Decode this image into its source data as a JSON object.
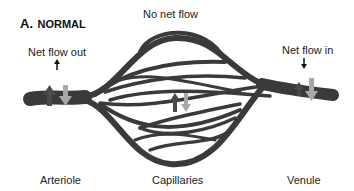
{
  "title": {
    "letter": "A.",
    "text": "NORMAL"
  },
  "labels": {
    "top_center": "No net flow",
    "left_flow": "Net flow out",
    "right_flow": "Net flow in",
    "bottom_left": "Arteriole",
    "bottom_center": "Capillaries",
    "bottom_right": "Venule"
  },
  "colors": {
    "vessel": "#3a3a3a",
    "arrow_dark": "#4a4a4a",
    "arrow_light": "#a8a8a8",
    "text": "#222222",
    "background": "#ffffff"
  }
}
